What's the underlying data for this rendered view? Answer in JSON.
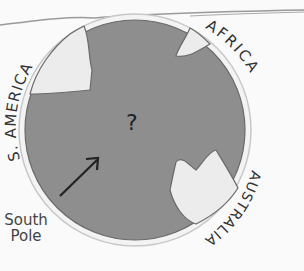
{
  "figure": {
    "labels": {
      "south_america": "S. AMERICA",
      "africa": "AFRICA",
      "australia": "AUSTRALIA",
      "south_pole_line1": "South",
      "south_pole_line2": "Pole",
      "center_mark": "?"
    },
    "colors": {
      "ocean": "#8e8e8e",
      "land": "#ececec",
      "outline": "#6a6a6a",
      "background": "#fafafa",
      "text": "#333333"
    },
    "arrow": {
      "direction": "up-right",
      "points_to": "globe center"
    }
  }
}
